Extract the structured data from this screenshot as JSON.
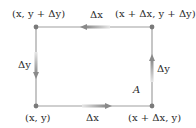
{
  "diagram": {
    "corners": {
      "top_left": "(x, y + Δy)",
      "top_right": "(x + Δx, y + Δy)",
      "bottom_left": "(x, y)",
      "bottom_right": "(x + Δx, y)"
    },
    "edges": {
      "top": "Δx",
      "bottom": "Δx",
      "left": "Δy",
      "right": "Δy"
    },
    "region_label": "A",
    "colors": {
      "line": "#9a9a9a",
      "dot": "#7a7a7a",
      "arrow_dark": "#808080",
      "arrow_light": "#e0e0e0",
      "text": "#2a2a2a"
    }
  }
}
